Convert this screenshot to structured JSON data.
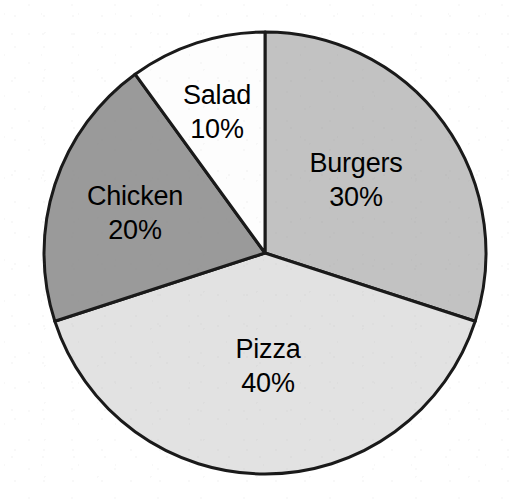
{
  "chart_data": {
    "type": "pie",
    "title": "",
    "subtitle": "",
    "xlabel": "",
    "ylabel": "",
    "legend_position": "none",
    "grid": false,
    "labels_inside_slices": true,
    "start_angle_deg": 0,
    "direction": "clockwise",
    "categories": [
      "Burgers",
      "Pizza",
      "Chicken",
      "Salad"
    ],
    "values": [
      30,
      40,
      20,
      10
    ],
    "value_unit": "%",
    "slices": [
      {
        "name": "Burgers",
        "value": 30,
        "percent_text": "30%",
        "color": "#c2c2c2",
        "start_deg": 0,
        "end_deg": 108,
        "label_x": 356,
        "label_y": 180
      },
      {
        "name": "Pizza",
        "value": 40,
        "percent_text": "40%",
        "color": "#e2e2e2",
        "start_deg": 108,
        "end_deg": 252,
        "label_x": 268,
        "label_y": 366
      },
      {
        "name": "Chicken",
        "value": 20,
        "percent_text": "20%",
        "color": "#9a9a9a",
        "start_deg": 252,
        "end_deg": 324,
        "label_x": 135,
        "label_y": 213
      },
      {
        "name": "Salad",
        "value": 10,
        "percent_text": "10%",
        "color": "#fdfdfd",
        "start_deg": 324,
        "end_deg": 360,
        "label_x": 217,
        "label_y": 112
      }
    ],
    "geometry": {
      "center_x": 265,
      "center_y": 253,
      "radius": 221
    },
    "style": {
      "outline_color": "#1a1a1a",
      "outline_width": 3,
      "background": "#ffffff",
      "label_color": "#000000"
    }
  }
}
